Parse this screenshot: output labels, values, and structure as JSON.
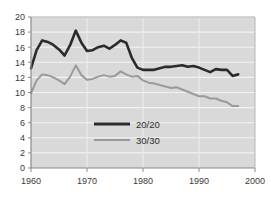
{
  "chart_data": {
    "type": "line",
    "title": "",
    "xlabel": "",
    "ylabel": "",
    "xlim": [
      1960,
      2000
    ],
    "ylim": [
      0,
      20
    ],
    "xticks": [
      1960,
      1970,
      1980,
      1990,
      2000
    ],
    "yticks": [
      0,
      2,
      4,
      6,
      8,
      10,
      12,
      14,
      16,
      18,
      20
    ],
    "grid": "horizontal",
    "legend_position": "center",
    "plot_background": "#d9d9d9",
    "gridline_color": "#f2f2f2",
    "axis_color": "#808080",
    "series": [
      {
        "name": "20/20",
        "color": "#2b2b2b",
        "width": 2.6,
        "x": [
          1960,
          1961,
          1962,
          1963,
          1964,
          1965,
          1966,
          1967,
          1968,
          1969,
          1970,
          1971,
          1972,
          1973,
          1974,
          1975,
          1976,
          1977,
          1978,
          1979,
          1980,
          1981,
          1982,
          1983,
          1984,
          1985,
          1986,
          1987,
          1988,
          1989,
          1990,
          1991,
          1992,
          1993,
          1994,
          1995,
          1996,
          1997
        ],
        "values": [
          13.2,
          15.6,
          16.9,
          16.7,
          16.3,
          15.7,
          14.9,
          16.3,
          18.2,
          16.6,
          15.5,
          15.6,
          16.0,
          16.2,
          15.8,
          16.3,
          16.9,
          16.6,
          14.6,
          13.3,
          13.0,
          13.0,
          13.0,
          13.2,
          13.4,
          13.4,
          13.5,
          13.6,
          13.4,
          13.5,
          13.3,
          13.0,
          12.7,
          13.1,
          13.0,
          13.0,
          12.2,
          12.4
        ]
      },
      {
        "name": "30/30",
        "color": "#9a9a9a",
        "width": 2.0,
        "x": [
          1960,
          1961,
          1962,
          1963,
          1964,
          1965,
          1966,
          1967,
          1968,
          1969,
          1970,
          1971,
          1972,
          1973,
          1974,
          1975,
          1976,
          1977,
          1978,
          1979,
          1980,
          1981,
          1982,
          1983,
          1984,
          1985,
          1986,
          1987,
          1988,
          1989,
          1990,
          1991,
          1992,
          1993,
          1994,
          1995,
          1996,
          1997
        ],
        "values": [
          9.9,
          11.6,
          12.4,
          12.3,
          12.0,
          11.6,
          11.1,
          12.1,
          13.6,
          12.3,
          11.7,
          11.8,
          12.1,
          12.3,
          12.1,
          12.2,
          12.8,
          12.4,
          12.1,
          12.2,
          11.6,
          11.3,
          11.2,
          11.0,
          10.8,
          10.6,
          10.7,
          10.4,
          10.1,
          9.8,
          9.5,
          9.5,
          9.2,
          9.2,
          8.9,
          8.7,
          8.2,
          8.2
        ]
      }
    ],
    "legend": [
      {
        "label": "20/20",
        "color": "#2b2b2b",
        "width": 3.0
      },
      {
        "label": "30/30",
        "color": "#9a9a9a",
        "width": 2.0
      }
    ]
  }
}
